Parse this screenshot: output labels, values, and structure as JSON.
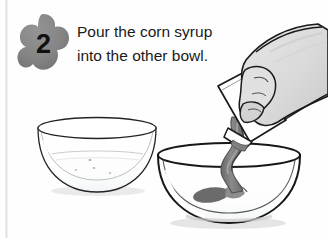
{
  "page": {
    "width": 328,
    "height": 238,
    "background_color": "#fefefe",
    "margin_rule_color": "#e0e0e0"
  },
  "step": {
    "number": "2",
    "badge_shape": "four-lobed-clover",
    "badge_color": "#848484",
    "badge_shadow_color": "#6f6f6f",
    "number_color": "#111111"
  },
  "instruction": {
    "full_text": "Pour the corn syrup into the other bowl.",
    "lines": [
      "Pour the corn syrup",
      "into the other bowl."
    ],
    "text_color": "#1a1a1a"
  },
  "illustration": {
    "description": "A hand tilts a white rectangular container pouring a gray ribbon of corn syrup into the right glass bowl, while an empty glass bowl sits at the left.",
    "colors": {
      "outline": "#1b1b1b",
      "glass_fill": "#ffffff",
      "glass_highlight": "#f4f6f7",
      "syrup": "#7e7e7e",
      "syrup_dark": "#5e5e5e",
      "syrup_puddle": "#6b6b6b",
      "skin": "#dcdcdc",
      "skin_shadow": "#c2c2c2",
      "container_fill": "#ffffff",
      "shadow": "#cfcfcf"
    },
    "objects": [
      {
        "name": "empty-bowl",
        "label": "Empty glass bowl",
        "x": 38,
        "y": 118,
        "width": 118,
        "height": 74
      },
      {
        "name": "receiving-bowl",
        "label": "Glass bowl receiving syrup",
        "x": 158,
        "y": 143,
        "width": 143,
        "height": 80
      },
      {
        "name": "syrup-stream",
        "label": "Corn syrup stream",
        "x": 228,
        "y": 120,
        "width": 24,
        "height": 72
      },
      {
        "name": "syrup-puddle",
        "label": "Corn syrup puddle",
        "x": 196,
        "y": 186,
        "width": 52,
        "height": 17
      },
      {
        "name": "syrup-container",
        "label": "Corn syrup container",
        "x": 213,
        "y": 68,
        "width": 70,
        "height": 76
      },
      {
        "name": "hand",
        "label": "Hand holding the container",
        "x": 225,
        "y": 24,
        "width": 100,
        "height": 110
      }
    ]
  }
}
